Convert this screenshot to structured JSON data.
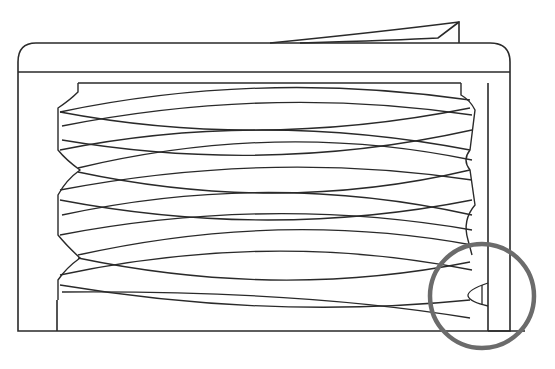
{
  "figure": {
    "type": "line-drawing",
    "colors": {
      "line": "#2a2a2a",
      "highlight_circle": "#6b6b6b",
      "background": "#ffffff"
    },
    "highlight": {
      "shape": "circle",
      "cx": 482,
      "cy": 296,
      "r": 52,
      "label": "thread end detail"
    }
  }
}
